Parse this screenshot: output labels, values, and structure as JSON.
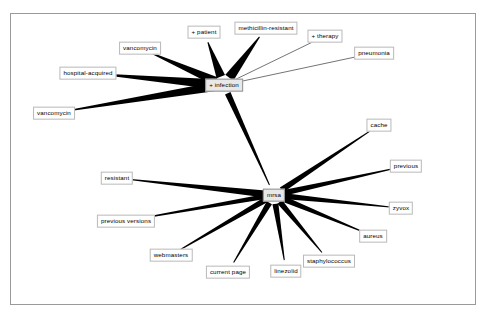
{
  "figure": {
    "background_color": "#ffffff",
    "border_color": "#9a9a9a",
    "edge_color": "#000000",
    "node_fill": "#ffffff",
    "node_border": "#b9b9b9",
    "hub_fill": "#e8e8e8"
  },
  "chart_data": {
    "type": "diagram",
    "title": "",
    "layout": "two hub-and-spoke node-link clusters",
    "nodes": [
      {
        "id": "infection",
        "label": "+ infection",
        "x": 224,
        "y": 85,
        "role": "hub"
      },
      {
        "id": "patient",
        "label": "+ patient",
        "x": 204,
        "y": 32,
        "role": "leaf"
      },
      {
        "id": "methicillin-resistant",
        "label": "methicillin-resistant",
        "x": 266,
        "y": 28,
        "role": "leaf"
      },
      {
        "id": "therapy",
        "label": "+ therapy",
        "x": 325,
        "y": 36,
        "role": "leaf"
      },
      {
        "id": "pneumonia",
        "label": "pneumonia",
        "x": 374,
        "y": 53,
        "role": "leaf"
      },
      {
        "id": "vancomycin-top",
        "label": "vancomycin",
        "x": 140,
        "y": 48,
        "role": "leaf"
      },
      {
        "id": "hospital-acquired",
        "label": "hospital-acquired",
        "x": 88,
        "y": 73,
        "role": "leaf"
      },
      {
        "id": "vancomycin-left",
        "label": "vancomycin",
        "x": 54,
        "y": 113,
        "role": "leaf"
      },
      {
        "id": "mrsa",
        "label": "mrsa",
        "x": 274,
        "y": 195,
        "role": "hub"
      },
      {
        "id": "cache",
        "label": "cache",
        "x": 379,
        "y": 125,
        "role": "leaf"
      },
      {
        "id": "previous",
        "label": "previous",
        "x": 406,
        "y": 166,
        "role": "leaf"
      },
      {
        "id": "zyvox",
        "label": "zyvox",
        "x": 401,
        "y": 208,
        "role": "leaf"
      },
      {
        "id": "aureus",
        "label": "aureus",
        "x": 373,
        "y": 236,
        "role": "leaf"
      },
      {
        "id": "staphylococcus",
        "label": "staphylococcus",
        "x": 329,
        "y": 261,
        "role": "leaf"
      },
      {
        "id": "linezolid",
        "label": "linezolid",
        "x": 286,
        "y": 271,
        "role": "leaf"
      },
      {
        "id": "current-page",
        "label": "current page",
        "x": 228,
        "y": 272,
        "role": "leaf"
      },
      {
        "id": "webmasters",
        "label": "webmasters",
        "x": 171,
        "y": 255,
        "role": "leaf"
      },
      {
        "id": "previous-versions",
        "label": "previous versions",
        "x": 126,
        "y": 221,
        "role": "leaf"
      },
      {
        "id": "resistant",
        "label": "resistant",
        "x": 117,
        "y": 178,
        "role": "leaf"
      }
    ],
    "edges": [
      {
        "source": "infection",
        "target": "patient",
        "style": "wedge",
        "weight": 9
      },
      {
        "source": "infection",
        "target": "methicillin-resistant",
        "style": "wedge",
        "weight": 10
      },
      {
        "source": "infection",
        "target": "vancomycin-top",
        "style": "wedge",
        "weight": 9
      },
      {
        "source": "infection",
        "target": "hospital-acquired",
        "style": "wedge",
        "weight": 10
      },
      {
        "source": "infection",
        "target": "vancomycin-left",
        "style": "wedge",
        "weight": 9
      },
      {
        "source": "infection",
        "target": "therapy",
        "style": "thin-line",
        "weight": 1
      },
      {
        "source": "infection",
        "target": "pneumonia",
        "style": "thin-line",
        "weight": 1
      },
      {
        "source": "infection",
        "target": "mrsa",
        "style": "wedge",
        "weight": 6
      },
      {
        "source": "mrsa",
        "target": "cache",
        "style": "wedge",
        "weight": 6
      },
      {
        "source": "mrsa",
        "target": "previous",
        "style": "wedge",
        "weight": 6
      },
      {
        "source": "mrsa",
        "target": "zyvox",
        "style": "wedge",
        "weight": 6
      },
      {
        "source": "mrsa",
        "target": "aureus",
        "style": "wedge",
        "weight": 6
      },
      {
        "source": "mrsa",
        "target": "staphylococcus",
        "style": "wedge",
        "weight": 6
      },
      {
        "source": "mrsa",
        "target": "linezolid",
        "style": "wedge",
        "weight": 6
      },
      {
        "source": "mrsa",
        "target": "current-page",
        "style": "wedge",
        "weight": 6
      },
      {
        "source": "mrsa",
        "target": "webmasters",
        "style": "wedge",
        "weight": 6
      },
      {
        "source": "mrsa",
        "target": "previous-versions",
        "style": "wedge",
        "weight": 5
      },
      {
        "source": "mrsa",
        "target": "resistant",
        "style": "wedge",
        "weight": 7
      }
    ]
  }
}
